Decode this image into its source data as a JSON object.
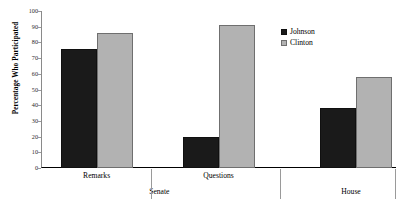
{
  "chart_data": {
    "type": "bar",
    "title": "",
    "xlabel": "",
    "ylabel": "Percentage Who Participated",
    "ylim": [
      0,
      100
    ],
    "ytick_labels": [
      "0",
      "10",
      "20",
      "30",
      "40",
      "50",
      "60",
      "70",
      "80",
      "90",
      "100"
    ],
    "ytick_values": [
      0,
      10,
      20,
      30,
      40,
      50,
      60,
      70,
      80,
      90,
      100
    ],
    "grid": false,
    "legend_position": "upper right",
    "categories": [
      "Remarks",
      "Questions",
      "House"
    ],
    "groups": [
      {
        "label": "Senate",
        "categories": [
          "Remarks",
          "Questions"
        ]
      },
      {
        "label": "House",
        "categories": [
          ""
        ]
      }
    ],
    "series": [
      {
        "name": "Johnson",
        "color": "#1a1a1a",
        "values": [
          76,
          20,
          38
        ]
      },
      {
        "name": "Clinton",
        "color": "#b2b2b2",
        "values": [
          86,
          91,
          58
        ]
      }
    ]
  },
  "legend": {
    "items": [
      {
        "label": "Johnson"
      },
      {
        "label": "Clinton"
      }
    ]
  },
  "axis": {
    "y_title": "Percentage Who Participated"
  }
}
